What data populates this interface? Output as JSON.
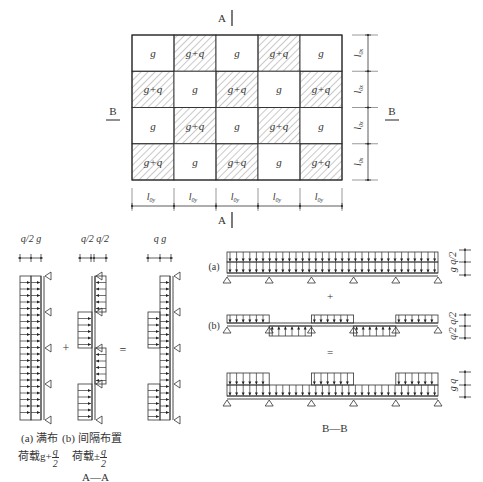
{
  "plan": {
    "section_a_top": "A",
    "section_a_bottom": "A",
    "section_b_left": "B",
    "section_b_right": "B",
    "rows": [
      [
        {
          "label": "g",
          "hatched": false
        },
        {
          "label": "g+q",
          "hatched": true
        },
        {
          "label": "g",
          "hatched": false
        },
        {
          "label": "g+q",
          "hatched": true
        },
        {
          "label": "g",
          "hatched": false
        }
      ],
      [
        {
          "label": "g+q",
          "hatched": true
        },
        {
          "label": "g",
          "hatched": false
        },
        {
          "label": "g+q",
          "hatched": true
        },
        {
          "label": "g",
          "hatched": false
        },
        {
          "label": "g+q",
          "hatched": true
        }
      ],
      [
        {
          "label": "g",
          "hatched": false
        },
        {
          "label": "g+q",
          "hatched": true
        },
        {
          "label": "g",
          "hatched": false
        },
        {
          "label": "g+q",
          "hatched": true
        },
        {
          "label": "g",
          "hatched": false
        }
      ],
      [
        {
          "label": "g+q",
          "hatched": true
        },
        {
          "label": "g",
          "hatched": false
        },
        {
          "label": "g+q",
          "hatched": true
        },
        {
          "label": "g",
          "hatched": false
        },
        {
          "label": "g+q",
          "hatched": true
        }
      ]
    ],
    "span_x_label": "l",
    "span_x_sub": "0y",
    "span_y_label": "l",
    "span_y_sub": "0x"
  },
  "section_aa": {
    "scale_labels": {
      "a": "q/2 g",
      "b": "q/2 q/2",
      "c": "q  g"
    },
    "plus": "+",
    "equals": "=",
    "caption_a_line1": "(a) 满布",
    "caption_a_line2": "荷载g+",
    "caption_b_line1": "(b) 间隔布置",
    "caption_b_line2": "荷载±",
    "frac_num": "q",
    "frac_den": "2",
    "title": "A—A"
  },
  "section_bb": {
    "label_a": "(a)",
    "label_b": "(b)",
    "plus": "+",
    "equals": "=",
    "dim_a": "g q/2",
    "dim_b": "q/2 q/2",
    "dim_c": "g  q",
    "title": "B—B",
    "spans": 5
  }
}
